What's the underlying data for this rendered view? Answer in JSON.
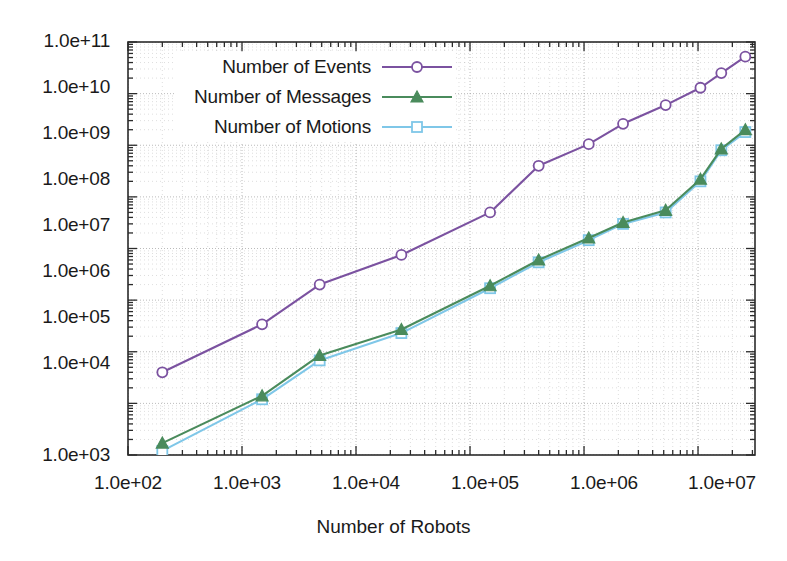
{
  "chart_data": {
    "type": "line",
    "title": "",
    "xlabel": "Number of Robots",
    "ylabel": "",
    "xscale": "log",
    "yscale": "log",
    "xlim": [
      100,
      31600000
    ],
    "ylim": [
      1000,
      100000000000
    ],
    "grid": true,
    "legend_position": "top-left-inside",
    "xticklabels": [
      "1.0e+02",
      "1.0e+03",
      "1.0e+04",
      "1.0e+05",
      "1.0e+06",
      "1.0e+07"
    ],
    "xtickvalues": [
      100,
      1000,
      10000,
      100000,
      1000000,
      10000000
    ],
    "yticklabels": [
      "1.0e+03",
      "1.0e+04",
      "1.0e+05",
      "1.0e+06",
      "1.0e+07",
      "1.0e+08",
      "1.0e+09",
      "1.0e+10",
      "1.0e+11"
    ],
    "ytickvalues": [
      1000,
      10000,
      100000,
      1000000,
      10000000,
      100000000,
      1000000000,
      10000000000,
      100000000000
    ],
    "series": [
      {
        "name": "Number of Events",
        "color": "#7B52A0",
        "marker": "circle-open",
        "x": [
          200,
          1500,
          4800,
          25000,
          150000,
          400000,
          1100000,
          2200000,
          5200000,
          10500000,
          16000000,
          26000000
        ],
        "y": [
          40000,
          340000,
          2000000,
          7500000,
          50000000,
          400000000,
          1050000000,
          2600000000,
          6000000000,
          13000000000,
          25000000000,
          52000000000
        ]
      },
      {
        "name": "Number of Messages",
        "color": "#4A8B5C",
        "marker": "triangle-filled",
        "x": [
          200,
          1500,
          4800,
          25000,
          150000,
          400000,
          1100000,
          2200000,
          5200000,
          10500000,
          16000000,
          26000000
        ],
        "y": [
          1700,
          14000,
          85000,
          270000,
          1900000,
          6000000,
          16000000,
          32000000,
          55000000,
          220000000,
          850000000,
          2000000000
        ]
      },
      {
        "name": "Number of Motions",
        "color": "#7FC7E8",
        "marker": "square-open",
        "x": [
          200,
          1500,
          4800,
          25000,
          150000,
          400000,
          1100000,
          2200000,
          5200000,
          10500000,
          16000000,
          26000000
        ],
        "y": [
          1200,
          12000,
          68000,
          230000,
          1700000,
          5400000,
          14500000,
          30000000,
          50000000,
          200000000,
          800000000,
          1800000000
        ]
      }
    ]
  },
  "axis": {
    "xaxis_title": "Number of Robots"
  }
}
